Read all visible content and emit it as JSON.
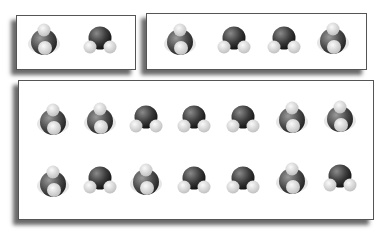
{
  "diagram": {
    "colors": {
      "oxygen": "#3a3a3a",
      "hydrogen": "#e6e6e6",
      "box_border": "#555555",
      "shadow": "#6a6a6a"
    },
    "boxes": [
      {
        "id": "box-1",
        "x": 16,
        "y": 15,
        "w": 118,
        "h": 53,
        "molecules": [
          {
            "orientation": "front",
            "cx": 44,
            "cy": 40
          },
          {
            "orientation": "side",
            "cx": 100,
            "cy": 40
          }
        ]
      },
      {
        "id": "box-2",
        "x": 146,
        "y": 13,
        "w": 219,
        "h": 55,
        "molecules": [
          {
            "orientation": "front",
            "cx": 180,
            "cy": 40
          },
          {
            "orientation": "side",
            "cx": 234,
            "cy": 40
          },
          {
            "orientation": "side",
            "cx": 284,
            "cy": 40
          },
          {
            "orientation": "front",
            "cx": 333,
            "cy": 39
          }
        ]
      },
      {
        "id": "box-3",
        "x": 18,
        "y": 80,
        "w": 354,
        "h": 138,
        "molecules": [
          {
            "orientation": "front",
            "cx": 53,
            "cy": 120
          },
          {
            "orientation": "front",
            "cx": 100,
            "cy": 119
          },
          {
            "orientation": "side",
            "cx": 146,
            "cy": 119
          },
          {
            "orientation": "side",
            "cx": 194,
            "cy": 119
          },
          {
            "orientation": "side",
            "cx": 243,
            "cy": 119
          },
          {
            "orientation": "front",
            "cx": 292,
            "cy": 118
          },
          {
            "orientation": "front",
            "cx": 340,
            "cy": 117
          },
          {
            "orientation": "front",
            "cx": 53,
            "cy": 182
          },
          {
            "orientation": "side",
            "cx": 100,
            "cy": 180
          },
          {
            "orientation": "front",
            "cx": 146,
            "cy": 180
          },
          {
            "orientation": "side",
            "cx": 194,
            "cy": 180
          },
          {
            "orientation": "side",
            "cx": 243,
            "cy": 180
          },
          {
            "orientation": "front",
            "cx": 292,
            "cy": 179
          },
          {
            "orientation": "side",
            "cx": 340,
            "cy": 178
          }
        ]
      }
    ]
  }
}
